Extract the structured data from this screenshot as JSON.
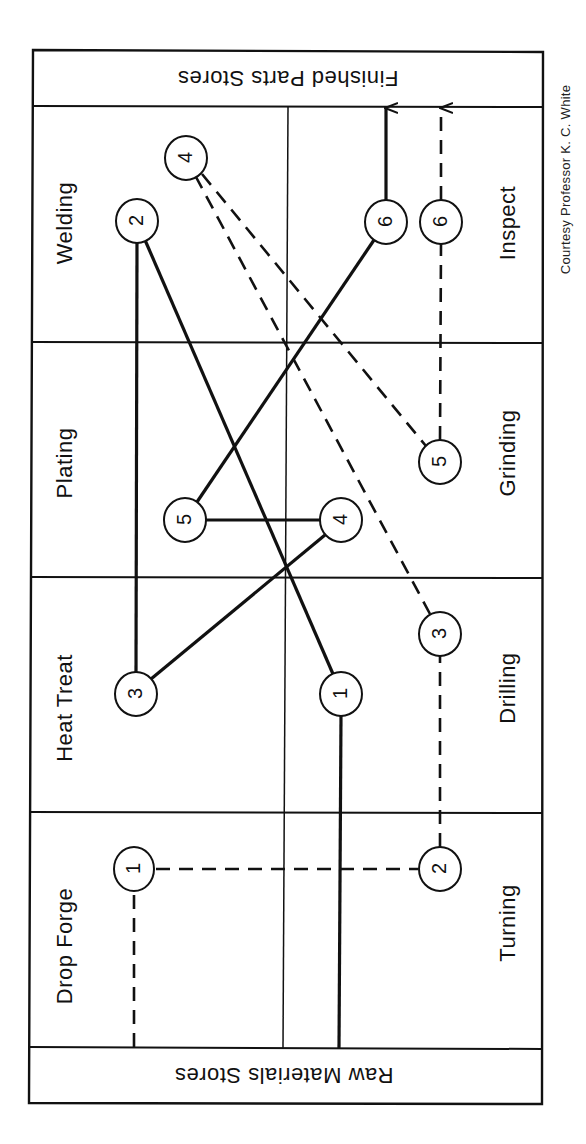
{
  "diagram": {
    "type": "from-to flow process chart (rotated)",
    "stores": {
      "top": "Finished Parts Stores",
      "bottom": "Raw Materials Stores"
    },
    "departments": {
      "left_column": [
        "Welding",
        "Plating",
        "Heat Treat",
        "Drop Forge"
      ],
      "right_column": [
        "Inspect",
        "Grinding",
        "Drilling",
        "Turning"
      ]
    },
    "credit": "Courtesy Professor K. C. White",
    "routes": [
      {
        "name": "solid",
        "style": "solid",
        "steps": [
          {
            "step": "1",
            "department": "Drilling"
          },
          {
            "step": "2",
            "department": "Welding"
          },
          {
            "step": "3",
            "department": "Heat Treat"
          },
          {
            "step": "4",
            "department": "Grinding"
          },
          {
            "step": "5",
            "department": "Plating"
          },
          {
            "step": "6",
            "department": "Inspect"
          }
        ],
        "start": "Raw Materials Stores",
        "end": "Finished Parts Stores"
      },
      {
        "name": "dashed",
        "style": "dashed",
        "steps": [
          {
            "step": "1",
            "department": "Drop Forge"
          },
          {
            "step": "2",
            "department": "Turning"
          },
          {
            "step": "3",
            "department": "Drilling"
          },
          {
            "step": "4",
            "department": "Welding"
          },
          {
            "step": "5",
            "department": "Grinding"
          },
          {
            "step": "6",
            "department": "Inspect"
          }
        ],
        "start": "Raw Materials Stores",
        "end": "Finished Parts Stores"
      }
    ],
    "node_labels": {
      "solid": [
        "1",
        "2",
        "3",
        "4",
        "5",
        "6"
      ],
      "dashed": [
        "1",
        "2",
        "3",
        "4",
        "5",
        "6"
      ]
    }
  }
}
